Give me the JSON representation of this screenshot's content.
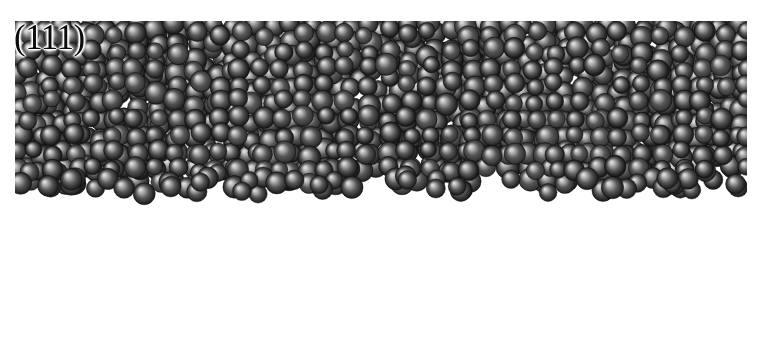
{
  "figure": {
    "domain_note": "molecular-dynamics-snapshot",
    "width": 764,
    "height": 349,
    "background_color": "#ffffff",
    "label": "(111)",
    "label_name": "crystal-plane-label",
    "caption_text": "",
    "content_bounds": {
      "left": 16,
      "top": 22,
      "right": 746,
      "bottom": 340
    }
  },
  "regions": [
    {
      "id": "disordered-phase",
      "name": "disordered-amorphous-region",
      "description": "densely packed disordered spheres",
      "top": 22,
      "bottom": 182,
      "sphere_diameter": 22,
      "packing": "random-dense",
      "fill_color": "#4a4a4a"
    },
    {
      "id": "crystalline-phase",
      "name": "ordered-crystal-lattice-region",
      "description": "regular rows of spheres in fcc (111) stacking",
      "top": 184,
      "bottom": 344,
      "sphere_diameter": 21,
      "row_spacing": 24,
      "column_spacing": 24.5,
      "rows": 7,
      "columns": 30,
      "fill_color": "#4a4a4a"
    }
  ],
  "palette": {
    "sphere_dark": "#2b2b2b",
    "sphere_mid": "#575757",
    "sphere_light": "#a8a8a8",
    "sphere_highlight": "#d8d8d8",
    "background": "#ffffff",
    "label_color": "#0b0b0b"
  },
  "chart_data": {
    "type": "scatter",
    "title": "(111)",
    "xlabel": "",
    "ylabel": "",
    "legend": [],
    "grid": false,
    "xlim": [
      0,
      764
    ],
    "ylim": [
      0,
      349
    ],
    "series": [
      {
        "name": "disordered-phase-atoms",
        "region": "top",
        "approx_count": 1150,
        "x_range": [
          18,
          746
        ],
        "y_range": [
          22,
          182
        ],
        "marker": "sphere",
        "marker_size": 22,
        "color": "#4a4a4a"
      },
      {
        "name": "crystal-lattice-atoms",
        "region": "bottom",
        "approx_count": 210,
        "x_range": [
          18,
          746
        ],
        "y_range": [
          190,
          340
        ],
        "marker": "sphere",
        "marker_size": 21,
        "color": "#4a4a4a",
        "row_y": [
          190,
          214,
          238,
          262,
          286,
          310,
          334
        ],
        "row_offsets": [
          0,
          12,
          0,
          12,
          0,
          12,
          0
        ],
        "column_spacing": 24.5
      }
    ],
    "annotations": [
      {
        "text": "(111)",
        "x": 16,
        "y": 28,
        "name": "crystal-plane-label"
      }
    ]
  }
}
